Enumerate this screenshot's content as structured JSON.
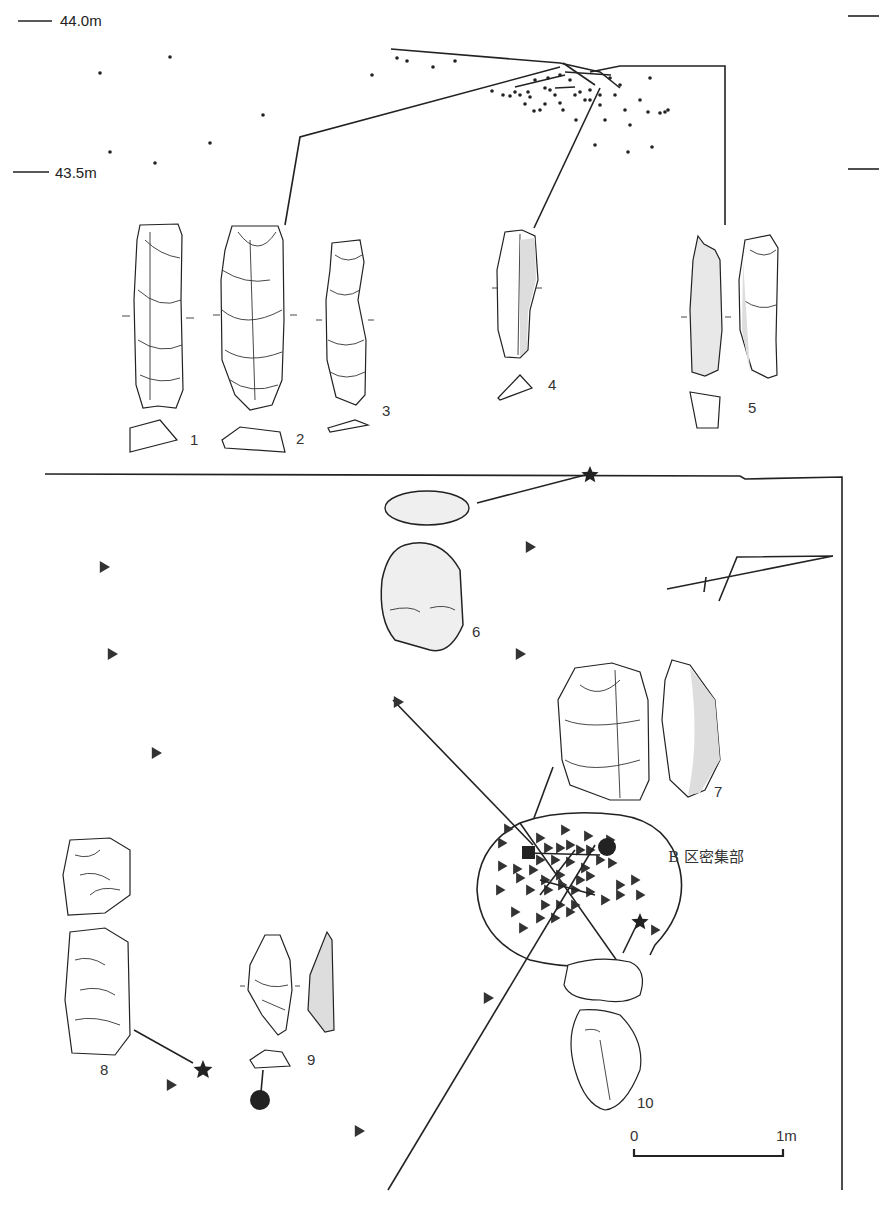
{
  "figure": {
    "elevation_labels": [
      "44.0m",
      "43.5m"
    ],
    "artifact_labels": [
      "1",
      "2",
      "3",
      "4",
      "5",
      "6",
      "7",
      "8",
      "9",
      "10"
    ],
    "cluster_label": "B 区密集部",
    "scale_bar": {
      "start_label": "0",
      "end_label": "1m"
    },
    "legend_symbols": {
      "triangle": "artifact-triangle-icon",
      "star": "refit-star-icon",
      "circle": "filled-circle-icon",
      "dot": "point-dot-icon"
    },
    "colors": {
      "ink": "#222222",
      "paper": "#ffffff"
    }
  }
}
